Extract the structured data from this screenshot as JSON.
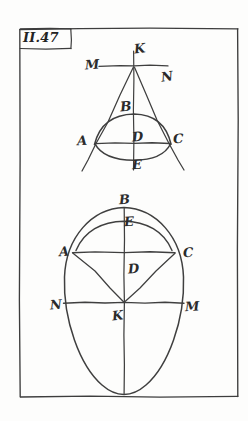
{
  "page": {
    "figure_number": "II.47",
    "background_color": "#fdfdfc",
    "ink_color": "#3a3a3a",
    "frame": {
      "x": 19,
      "y": 28,
      "width": 219,
      "height": 369
    }
  },
  "upper_figure": {
    "name": "triangle-with-arcs",
    "description": "Isosceles triangle with apex K on horizontal line MN, chord AC, circular arc through B above and arc through E below",
    "labels": [
      {
        "id": "K",
        "text": "K",
        "x": 134,
        "y": 42,
        "role": "apex-point"
      },
      {
        "id": "M",
        "text": "M",
        "x": 85,
        "y": 58,
        "role": "left-line-endpoint"
      },
      {
        "id": "N",
        "text": "N",
        "x": 161,
        "y": 70,
        "role": "right-line-endpoint"
      },
      {
        "id": "B",
        "text": "B",
        "x": 120,
        "y": 100,
        "role": "arc-top-point"
      },
      {
        "id": "A",
        "text": "A",
        "x": 77,
        "y": 134,
        "role": "chord-left-point"
      },
      {
        "id": "D",
        "text": "D",
        "x": 132,
        "y": 130,
        "role": "center-point"
      },
      {
        "id": "C",
        "text": "C",
        "x": 173,
        "y": 132,
        "role": "chord-right-point"
      },
      {
        "id": "E",
        "text": "E",
        "x": 132,
        "y": 158,
        "role": "arc-bottom-point"
      }
    ]
  },
  "lower_figure": {
    "name": "oval-with-chords",
    "description": "Vertical oval with horizontal diameter NM through center K, chord AC, arc through B and E at top, radii KA and KC",
    "labels": [
      {
        "id": "B",
        "text": "B",
        "x": 119,
        "y": 193,
        "role": "oval-top-point"
      },
      {
        "id": "E",
        "text": "E",
        "x": 124,
        "y": 215,
        "role": "upper-arc-point"
      },
      {
        "id": "A",
        "text": "A",
        "x": 59,
        "y": 245,
        "role": "chord-left-point"
      },
      {
        "id": "C",
        "text": "C",
        "x": 183,
        "y": 246,
        "role": "chord-right-point"
      },
      {
        "id": "D",
        "text": "D",
        "x": 128,
        "y": 262,
        "role": "chord-midpoint"
      },
      {
        "id": "N",
        "text": "N",
        "x": 50,
        "y": 298,
        "role": "diameter-left-point"
      },
      {
        "id": "K",
        "text": "K",
        "x": 112,
        "y": 309,
        "role": "oval-center-point"
      },
      {
        "id": "M",
        "text": "M",
        "x": 185,
        "y": 300,
        "role": "diameter-right-point"
      }
    ]
  }
}
